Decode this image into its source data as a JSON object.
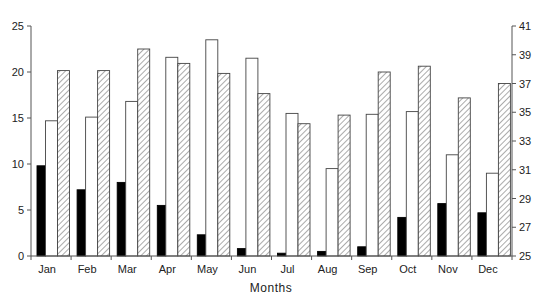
{
  "chart_data": {
    "type": "bar",
    "title": "",
    "xlabel": "Months",
    "ylabel": "",
    "y2label": "",
    "categories": [
      "Jan",
      "Feb",
      "Mar",
      "Apr",
      "May",
      "Jun",
      "Jul",
      "Aug",
      "Sep",
      "Oct",
      "Nov",
      "Dec"
    ],
    "ylim": [
      0,
      25
    ],
    "y2lim": [
      25,
      41
    ],
    "yticks": [
      0,
      5,
      10,
      15,
      20,
      25
    ],
    "y2ticks": [
      25,
      27,
      29,
      31,
      33,
      35,
      37,
      39,
      41
    ],
    "grid": false,
    "legend": "none",
    "series": [
      {
        "name": "Series 1 (black)",
        "axis": "left",
        "fill": "#000000",
        "values": [
          9.8,
          7.2,
          8.0,
          5.5,
          2.3,
          0.8,
          0.3,
          0.5,
          1.0,
          4.2,
          5.7,
          4.7
        ]
      },
      {
        "name": "Series 2 (white)",
        "axis": "left",
        "fill": "#ffffff",
        "values": [
          14.7,
          15.1,
          16.8,
          21.6,
          23.5,
          21.5,
          15.5,
          9.5,
          15.4,
          15.7,
          11.0,
          9.0
        ]
      },
      {
        "name": "Series 3 (hatched)",
        "axis": "right",
        "fill": "hatch",
        "values": [
          37.9,
          37.9,
          39.4,
          38.4,
          37.7,
          36.3,
          34.2,
          34.8,
          37.8,
          38.2,
          36.0,
          37.0
        ]
      }
    ]
  },
  "colors": {
    "axis": "#555555",
    "bar_outline": "#444444",
    "hatch": "#666666"
  }
}
